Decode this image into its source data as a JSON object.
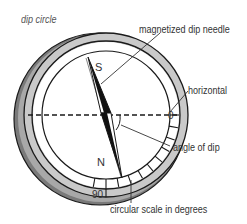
{
  "title": "dip circle",
  "labels": {
    "needle": "magnetized dip needle",
    "horizontal": "horizontal",
    "angle": "angle of dip",
    "scale": "circular scale in degrees"
  },
  "markings": {
    "south": "S",
    "north": "N",
    "zero": "0",
    "ninety": "90"
  },
  "colors": {
    "ring_fill": "#c8c8c8",
    "rim_dark": "#6e6e6e",
    "line": "#1a1a1a",
    "text": "#333333"
  }
}
